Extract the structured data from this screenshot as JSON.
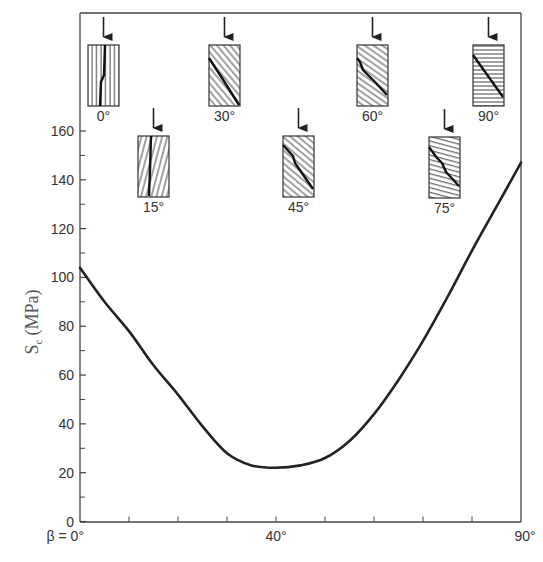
{
  "chart_data": {
    "type": "line",
    "title": "",
    "xlabel": "β",
    "ylabel": "S_c (MPa)",
    "ylabel_main": "S",
    "ylabel_sub": "c",
    "ylabel_unit": "(MPa)",
    "xlim": [
      0,
      90
    ],
    "ylim": [
      0,
      160
    ],
    "grid": false,
    "legend": null,
    "x_tick_labels": [
      {
        "value": 0,
        "label": "β = 0°"
      },
      {
        "value": 40,
        "label": "40°"
      },
      {
        "value": 90,
        "label": "90°"
      }
    ],
    "x_minor_ticks": [
      10,
      20,
      30,
      40,
      50,
      60,
      70,
      80
    ],
    "y_tick_labels": [
      {
        "value": 0,
        "label": "0"
      },
      {
        "value": 20,
        "label": "20"
      },
      {
        "value": 40,
        "label": "40"
      },
      {
        "value": 60,
        "label": "60"
      },
      {
        "value": 80,
        "label": "80"
      },
      {
        "value": 100,
        "label": "100"
      },
      {
        "value": 120,
        "label": "120"
      },
      {
        "value": 140,
        "label": "140"
      },
      {
        "value": 160,
        "label": "160"
      }
    ],
    "y_minor_ticks": [
      10,
      30,
      50,
      70,
      90,
      110,
      130,
      150
    ],
    "series": [
      {
        "name": "Uniaxial compressive strength vs. bedding angle",
        "x": [
          0,
          5,
          10,
          15,
          20,
          25,
          30,
          35,
          40,
          45,
          50,
          55,
          60,
          65,
          70,
          75,
          80,
          85,
          90
        ],
        "values": [
          104,
          90,
          78,
          64,
          52,
          39,
          28,
          23,
          22,
          23,
          26,
          33,
          44,
          58,
          74,
          92,
          111,
          129,
          147
        ]
      }
    ],
    "annotations": [
      {
        "type": "specimen",
        "label": "0°",
        "angle": 0,
        "row": "top"
      },
      {
        "type": "specimen",
        "label": "15°",
        "angle": 15,
        "row": "bottom"
      },
      {
        "type": "specimen",
        "label": "30°",
        "angle": 30,
        "row": "top"
      },
      {
        "type": "specimen",
        "label": "45°",
        "angle": 45,
        "row": "bottom"
      },
      {
        "type": "specimen",
        "label": "60°",
        "angle": 60,
        "row": "top"
      },
      {
        "type": "specimen",
        "label": "75°",
        "angle": 75,
        "row": "bottom"
      },
      {
        "type": "specimen",
        "label": "90°",
        "angle": 90,
        "row": "top"
      }
    ]
  },
  "colors": {
    "axis": "#444444",
    "curve": "#222222",
    "text": "#333333",
    "hatch": "#555555",
    "fracture": "#111111"
  }
}
